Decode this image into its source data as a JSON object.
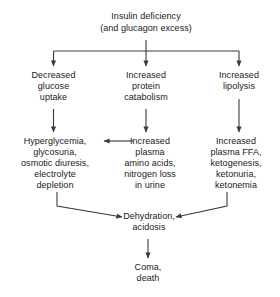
{
  "diagram": {
    "type": "flowchart",
    "title_node": "Insulin deficiency\n(and glucagon excess)",
    "stroke_color": "#3a3a3a",
    "text_color": "#1a1a1a",
    "background_color": "#ffffff",
    "nodes": {
      "root": "Insulin deficiency\n(and glucagon excess)",
      "left_1": "Decreased\nglucose\nuptake",
      "center_1": "Increased\nprotein\ncatabolism",
      "right_1": "Increased\nlipolysis",
      "left_2": "Hyperglycemia,\nglycosuria,\nosmotic diuresis,\nelectrolyte\ndepletion",
      "center_2": "Increased\nplasma\namino acids,\nnitrogen loss\nin urine",
      "right_2": "Increased\nplasma FFA,\nketogenesis,\nketonuria,\nketonemia",
      "converge": "Dehydration,\nacidosis",
      "terminal": "Coma,\ndeath"
    },
    "edges": [
      {
        "from": "root",
        "to": "left_1",
        "style": "elbow-down"
      },
      {
        "from": "root",
        "to": "center_1",
        "style": "straight-down"
      },
      {
        "from": "root",
        "to": "right_1",
        "style": "elbow-down"
      },
      {
        "from": "left_1",
        "to": "left_2",
        "style": "straight-down"
      },
      {
        "from": "center_1",
        "to": "center_2",
        "style": "straight-down"
      },
      {
        "from": "right_1",
        "to": "right_2",
        "style": "straight-down"
      },
      {
        "from": "center_2",
        "to": "left_2",
        "style": "straight-left"
      },
      {
        "from": "left_2",
        "to": "converge",
        "style": "elbow-diagonal"
      },
      {
        "from": "right_2",
        "to": "converge",
        "style": "elbow-diagonal"
      },
      {
        "from": "converge",
        "to": "terminal",
        "style": "straight-down"
      }
    ]
  }
}
